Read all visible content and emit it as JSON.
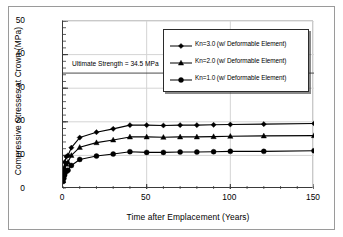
{
  "chart_data": {
    "type": "line",
    "title": "",
    "xlabel": "Time after Emplacement (Years)",
    "ylabel": "Compressive Stresses at Crown (MPa)",
    "xlim": [
      0,
      150
    ],
    "ylim": [
      0,
      50
    ],
    "xticks": [
      0,
      50,
      100,
      150
    ],
    "yticks": [
      0,
      10,
      20,
      30,
      40,
      50
    ],
    "x_minor_step": 10,
    "y_minor_step": 2,
    "grid": true,
    "legend_position": "upper right",
    "annotations": [
      {
        "text": "Ultimate Strength = 34.5 MPa",
        "value": 34.5,
        "type": "horizontal-reference-line"
      }
    ],
    "series": [
      {
        "name": "Kn=3.0 (w/ Deformable Element)",
        "marker": "diamond",
        "color": "#000000",
        "x": [
          0,
          0.5,
          1,
          2,
          3,
          5,
          10,
          20,
          30,
          40,
          50,
          60,
          70,
          80,
          90,
          100,
          120,
          150
        ],
        "values": [
          2.8,
          6.0,
          8.0,
          9.6,
          10.0,
          12.3,
          15.3,
          16.9,
          17.9,
          19.0,
          19.0,
          18.9,
          19.0,
          19.0,
          19.1,
          19.2,
          19.3,
          19.5
        ]
      },
      {
        "name": "Kn=2.0 (w/ Deformable Element)",
        "marker": "triangle",
        "color": "#000000",
        "x": [
          0,
          0.5,
          1,
          2,
          3,
          5,
          10,
          20,
          30,
          40,
          50,
          60,
          70,
          80,
          90,
          100,
          120,
          150
        ],
        "values": [
          2.5,
          4.6,
          6.2,
          7.4,
          8.0,
          10.0,
          12.4,
          13.8,
          14.6,
          15.5,
          15.5,
          15.4,
          15.5,
          15.5,
          15.6,
          15.7,
          15.8,
          15.9
        ]
      },
      {
        "name": "Kn=1.0 (w/ Deformable Element)",
        "marker": "circle",
        "color": "#000000",
        "x": [
          0,
          0.5,
          1,
          2,
          3,
          5,
          10,
          20,
          30,
          40,
          50,
          60,
          70,
          80,
          90,
          100,
          120,
          150
        ],
        "values": [
          2.2,
          3.2,
          4.2,
          5.2,
          5.6,
          7.0,
          8.8,
          9.8,
          10.4,
          11.1,
          10.9,
          10.9,
          11.0,
          11.0,
          11.1,
          11.2,
          11.2,
          11.4
        ]
      }
    ]
  },
  "axis": {
    "ytick_labels": [
      "0",
      "10",
      "20",
      "30",
      "40",
      "50"
    ],
    "xtick_labels": [
      "0",
      "50",
      "100",
      "150"
    ],
    "ylabel": "Compressive Stresses at Crown (MPa)",
    "xlabel": "Time after Emplacement (Years)"
  },
  "annotation": {
    "ultimate_strength": "Ultimate Strength = 34.5 MPa"
  },
  "legend": {
    "items": [
      {
        "label": "Kn=3.0 (w/ Deformable Element)",
        "marker": "diamond"
      },
      {
        "label": "Kn=2.0 (w/ Deformable Element)",
        "marker": "triangle"
      },
      {
        "label": "Kn=1.0 (w/ Deformable Element)",
        "marker": "circle"
      }
    ]
  },
  "colors": {
    "line": "#000000",
    "grid": "#d4d4d4",
    "axis": "#3a3a3a",
    "background": "#ffffff"
  }
}
